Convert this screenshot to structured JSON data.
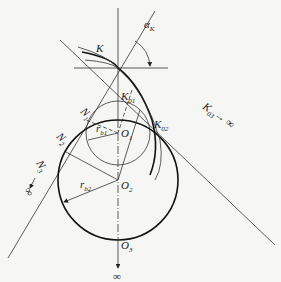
{
  "diagram": {
    "type": "involute gear geometry — pressure angle and base circles",
    "labels": {
      "K": "K",
      "alpha": "α",
      "alpha_sub": "K",
      "K01": "K",
      "K01_sub": "01",
      "K02": "K",
      "K02_sub": "02",
      "K03": "K",
      "K03_sub": "03",
      "K03_to": "→ ∞",
      "N1": "N",
      "N1_sub": "1",
      "N2": "N",
      "N2_sub": "2",
      "N3": "N",
      "N3_sub": "3",
      "N3_inf": "∞",
      "O1": "O",
      "O1_sub": "1",
      "O2": "O",
      "O2_sub": "2",
      "O3": "O",
      "O3_sub": "3",
      "rb1": "r",
      "rb1_sub": "b1",
      "rb2": "r",
      "rb2_sub": "b2",
      "bottom_inf": "∞"
    },
    "colors": {
      "background": "#f6f6f4",
      "line": "#222222"
    }
  }
}
